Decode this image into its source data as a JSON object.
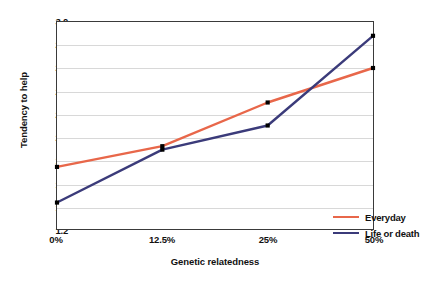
{
  "chart_data": {
    "type": "line",
    "title": "",
    "subtitle": "",
    "xlabel": "Genetic relatedness",
    "ylabel": "Tendency to help",
    "categories": [
      "0%",
      "12.5%",
      "25%",
      "50%"
    ],
    "x_tick_labels": [
      "0%",
      "12.5%",
      "25%",
      "50%"
    ],
    "y_tick_labels": [
      "3.0",
      "2.8",
      "2.6",
      "2.4",
      "2.2",
      "2.0",
      "1.8",
      "1.6",
      "1.4",
      "1.2"
    ],
    "y_ticks": [
      3.0,
      2.8,
      2.6,
      2.4,
      2.2,
      2.0,
      1.8,
      1.6,
      1.4,
      1.2
    ],
    "ylim": [
      1.2,
      3.0
    ],
    "grid": "horizontal",
    "legend_position": "bottom-right",
    "markers": "black-square",
    "series": [
      {
        "name": "Everyday",
        "color": "#E8674A",
        "values": [
          1.74,
          1.92,
          2.3,
          2.6
        ]
      },
      {
        "name": "Life or death",
        "color": "#3B3B7A",
        "values": [
          1.43,
          1.89,
          2.1,
          2.88
        ]
      }
    ]
  },
  "legend": {
    "items": [
      {
        "label": "Everyday",
        "color": "#E8674A"
      },
      {
        "label": "Life or death",
        "color": "#3B3B7A"
      }
    ]
  },
  "axes": {
    "x_title": "Genetic relatedness",
    "y_title": "Tendency to help"
  }
}
